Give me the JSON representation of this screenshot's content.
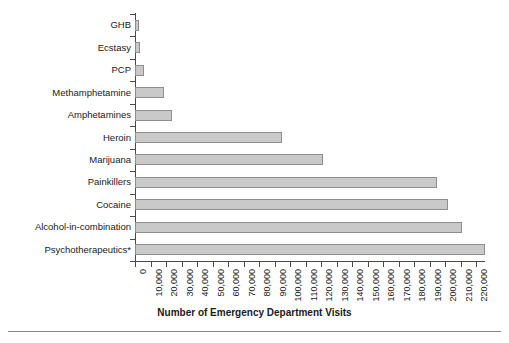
{
  "chart_data": {
    "type": "bar",
    "orientation": "horizontal",
    "title": "",
    "xlabel": "Number of Emergency Department Visits",
    "ylabel": "",
    "categories": [
      "GHB",
      "Ecstasy",
      "PCP",
      "Methamphetamine",
      "Amphetamines",
      "Heroin",
      "Marijuana",
      "Painkillers",
      "Cocaine",
      "Alcohol-in-combination",
      "Psychotherapeutics*"
    ],
    "values": [
      2500,
      3000,
      5500,
      19000,
      24000,
      95000,
      121000,
      195000,
      202000,
      211000,
      226000
    ],
    "xlim": [
      0,
      230000
    ],
    "xticks": [
      0,
      10000,
      20000,
      30000,
      40000,
      50000,
      60000,
      70000,
      80000,
      90000,
      100000,
      110000,
      120000,
      130000,
      140000,
      150000,
      160000,
      170000,
      180000,
      190000,
      200000,
      210000,
      220000
    ],
    "xtick_labels": [
      "0",
      "10,000",
      "20,000",
      "30,000",
      "40,000",
      "50,000",
      "60,000",
      "70,000",
      "80,000",
      "90,000",
      "100,000",
      "110,000",
      "120,000",
      "130,000",
      "140,000",
      "150,000",
      "160,000",
      "170,000",
      "180,000",
      "190,000",
      "200,000",
      "210,000",
      "220,000"
    ],
    "grid": false,
    "legend": null,
    "bar_fill_color": "#c9c9c9",
    "bar_edge_color": "#8e8e8e",
    "axis_color": "#4a4a4a",
    "background_color": "#ffffff"
  }
}
